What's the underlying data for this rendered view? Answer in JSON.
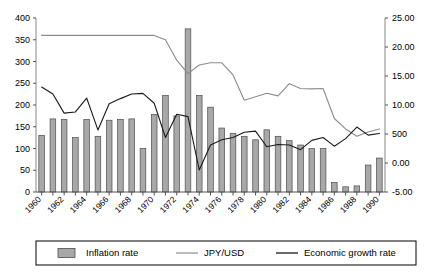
{
  "chart_data": {
    "type": "bar",
    "title": "",
    "xlabel": "",
    "ylabel": "",
    "grid": false,
    "legend_position": "bottom",
    "x": [
      1960,
      1961,
      1962,
      1963,
      1964,
      1965,
      1966,
      1967,
      1968,
      1969,
      1970,
      1971,
      1972,
      1973,
      1974,
      1975,
      1976,
      1977,
      1978,
      1979,
      1980,
      1981,
      1982,
      1983,
      1984,
      1985,
      1986,
      1987,
      1988,
      1989,
      1990
    ],
    "x_tick_labels": [
      "1960",
      "1962",
      "1964",
      "1966",
      "1968",
      "1970",
      "1972",
      "1974",
      "1976",
      "1978",
      "1980",
      "1982",
      "1984",
      "1986",
      "1988",
      "1990"
    ],
    "left_axis": {
      "ylim": [
        0,
        400
      ],
      "ticks": [
        0,
        50,
        100,
        150,
        200,
        250,
        300,
        350,
        400
      ],
      "tick_labels": [
        "0",
        "50",
        "100",
        "150",
        "200",
        "250",
        "300",
        "350",
        "400"
      ]
    },
    "right_axis": {
      "ylim": [
        -5.0,
        25.0
      ],
      "ticks": [
        -5.0,
        0.0,
        5.0,
        10.0,
        15.0,
        20.0,
        25.0
      ],
      "tick_labels": [
        "-5.00",
        "0.00",
        "500",
        "10.00",
        "15.00",
        "20.00",
        "25.00"
      ]
    },
    "series": [
      {
        "name": "Inflation rate",
        "type": "bar",
        "axis": "left",
        "color": "#a8a8a8",
        "edge_color": "#4d4d4d",
        "values": [
          130,
          168,
          167,
          125,
          167,
          128,
          165,
          167,
          168,
          100,
          178,
          222,
          175,
          375,
          222,
          195,
          147,
          135,
          128,
          120,
          143,
          128,
          118,
          108,
          100,
          100,
          22,
          12,
          14,
          62,
          78
        ]
      },
      {
        "name": "JPY/USD",
        "type": "line",
        "axis": "left",
        "color": "#8c8c8c",
        "values": [
          360,
          360,
          360,
          360,
          360,
          360,
          360,
          360,
          360,
          360,
          360,
          350,
          303,
          272,
          292,
          297,
          297,
          269,
          211,
          219,
          227,
          221,
          249,
          238,
          237,
          238,
          169,
          145,
          128,
          138,
          145
        ]
      },
      {
        "name": "Economic growth rate",
        "type": "line",
        "axis": "right",
        "color": "#1a1a1a",
        "values": [
          13.1,
          11.9,
          8.6,
          8.8,
          11.2,
          5.7,
          10.2,
          11.1,
          11.9,
          12.0,
          10.3,
          4.4,
          8.4,
          8.0,
          -1.2,
          3.1,
          4.0,
          4.4,
          5.3,
          5.5,
          2.8,
          3.2,
          3.1,
          2.3,
          3.9,
          4.4,
          2.9,
          4.2,
          6.2,
          4.8,
          5.1
        ]
      }
    ]
  },
  "legend": {
    "items": [
      {
        "label": "Inflation rate",
        "marker": "bar-swatch"
      },
      {
        "label": "JPY/USD",
        "marker": "line-swatch-gray"
      },
      {
        "label": "Economic growth rate",
        "marker": "line-swatch-black"
      }
    ]
  }
}
